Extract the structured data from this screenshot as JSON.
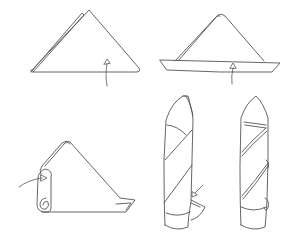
{
  "diagram": {
    "title": "",
    "line_color": "#555555",
    "background": "#ffffff",
    "steps": [
      {
        "id": 1,
        "label": "",
        "shape": "triangle-fold",
        "note": "layered triangle with up-pointing fold arrow"
      },
      {
        "id": 2,
        "label": "",
        "shape": "triangle-with-folded-hem",
        "note": "bottom edge folded up, arrow indicates fold"
      },
      {
        "id": 3,
        "label": "",
        "shape": "rolled-triangle",
        "note": "napkin rolled from left, arrow indicates roll direction"
      },
      {
        "id": 4,
        "label": "",
        "shape": "rolled-cone-tuck",
        "note": "rolled cone with corner being tucked, arrow indicates tuck"
      },
      {
        "id": 5,
        "label": "",
        "shape": "finished-cone",
        "note": "finished standing spiral cone"
      }
    ]
  }
}
